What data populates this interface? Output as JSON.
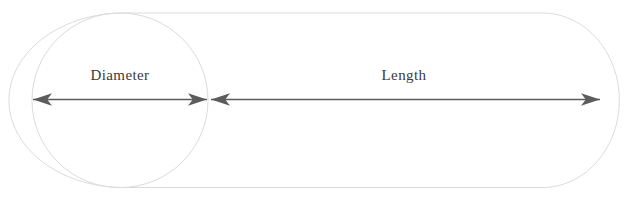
{
  "diagram": {
    "shape_name": "capsule-cylinder",
    "background_color": "#ffffff",
    "outline_color": "#dcdcdc",
    "arrow_color": "#5c5c5c",
    "label_color": "#3a3a3a",
    "labels": {
      "diameter": "Diameter",
      "length": "Length"
    },
    "dimensions": [
      {
        "name": "diameter",
        "label": "Diameter",
        "arrow_type": "double-headed",
        "x_start": 33,
        "x_end": 207,
        "y": 99,
        "label_x": 120,
        "label_y": 80
      },
      {
        "name": "length",
        "label": "Length",
        "arrow_type": "double-headed",
        "x_start": 211,
        "x_end": 600,
        "y": 99,
        "label_x": 404,
        "label_y": 80
      }
    ],
    "geometry": {
      "capsule_left": 5,
      "capsule_right": 622,
      "capsule_top": 13,
      "capsule_bottom": 188,
      "circle_center_x": 120,
      "circle_center_y": 100,
      "circle_radius_x": 88,
      "circle_radius_y": 87
    }
  }
}
